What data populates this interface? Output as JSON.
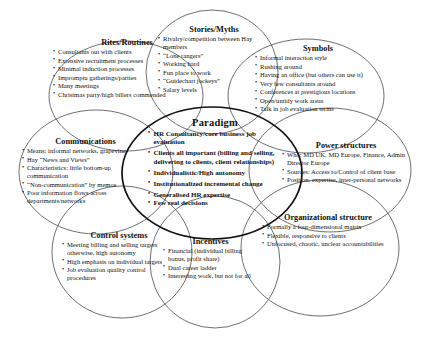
{
  "diagram": {
    "type": "cultural-web",
    "center": {
      "title": "Paradigm",
      "items": [
        "HR Consultancy/core business job evaluation",
        "Clients all important (billing and selling, delivering to clients, client relationships)",
        "Individualistic/High autonomy",
        "Institutionalized incremental change",
        "Generalised HR expertise",
        "Few real decisions"
      ]
    },
    "petals": [
      {
        "key": "rites",
        "title": "Rites/Routines",
        "items": [
          "Consultants out with clients",
          "Extensive recruitment processes",
          "Minimal induction processes",
          "Impromptu gatherings/parties",
          "Many meetings",
          "Christmas party/high billers commended"
        ]
      },
      {
        "key": "stories",
        "title": "Stories/Myths",
        "items": [
          "Rivalry/competition between Hay members",
          "“Lone rangers”",
          "Working hard",
          "Fun place to work",
          "“Guidechart jockeys”",
          "Salary levels"
        ]
      },
      {
        "key": "symbols",
        "title": "Symbols",
        "items": [
          "Informal interaction style",
          "Rushing around",
          "Having an office (but others can use it)",
          "Very few consultants around",
          "Conferences at prestigious locations",
          "Open/untidy work areas",
          "Talk in job evaluation terms"
        ]
      },
      {
        "key": "power",
        "title": "Power structures",
        "items": [
          "Who: MD UK, MD Europe, Finance,  Admin Director Europe",
          "Sources: Access to/Control of client base",
          "Position, expertise, inter-personal networks"
        ]
      },
      {
        "key": "orgstructure",
        "title": "Organizational structure",
        "items": [
          "Formally a four-dimensional matrix",
          "Flexible, responsive to clients",
          "Unfocused, chaotic, unclear accountabilities"
        ]
      },
      {
        "key": "incentives",
        "title": "Incentives",
        "items": [
          "Financial (individual billing bonus, profit share)",
          "Dual career ladder",
          "Interesting work, but not for all"
        ]
      },
      {
        "key": "controls",
        "title": "Control systems",
        "items": [
          "Meeting billing and selling targets otherwise, high autonomy",
          "High emphasis on individual targets",
          "Job evaluation quality control procedures"
        ]
      },
      {
        "key": "communications",
        "title": "Communications",
        "items": [
          "Means: informal networks, grapevine",
          "Hay “News and Views”",
          "Characteristics: little bottom-up communication",
          "“Non-communication” by memos",
          "Poor information flows across departments/networks"
        ]
      }
    ],
    "style": {
      "stroke": "#4a4a4a",
      "center_stroke": "#111111",
      "background": "#ffffff"
    }
  }
}
